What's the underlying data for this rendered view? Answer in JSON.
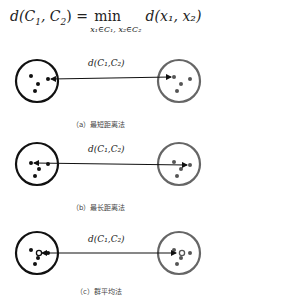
{
  "formula": {
    "lhs": "d(C",
    "lhs_sub1": "1",
    "lhs_mid": ", C",
    "lhs_sub2": "2",
    "lhs_end": ") =",
    "operator": "min",
    "operator_subscript": "x₁∈C₁, x₂∈C₂",
    "rhs": "d(x₁, x₂)"
  },
  "panels": [
    {
      "id": "a",
      "distance_label": "d(C₁,C₂)",
      "caption": "（a）最短距离法",
      "method": "single-linkage"
    },
    {
      "id": "b",
      "distance_label": "d(C₁,C₂)",
      "caption": "（b）最长距离法",
      "method": "complete-linkage"
    },
    {
      "id": "c",
      "distance_label": "d(C₁,C₂)",
      "caption": "（c）群平均法",
      "method": "average-linkage"
    }
  ],
  "colors": {
    "left_cluster": "#111111",
    "right_cluster": "#666666",
    "arrow": "#111111"
  }
}
